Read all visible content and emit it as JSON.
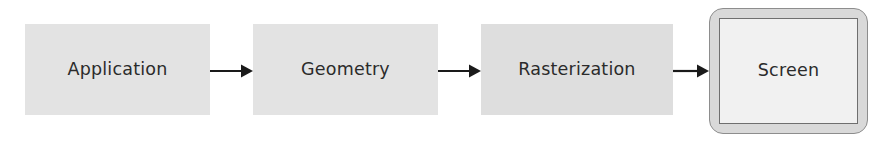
{
  "diagram": {
    "type": "flowchart",
    "orientation": "left-to-right",
    "background_color": "#ffffff",
    "stage_fill_color": "#e3e3e3",
    "screen_bezel_color": "#d9d9d9",
    "screen_inner_color": "#f1f1f1",
    "text_color": "#2b2b2b",
    "arrow_color": "#1a1a1a",
    "stages": [
      {
        "id": "application",
        "label": "Application",
        "shape": "rectangle"
      },
      {
        "id": "geometry",
        "label": "Geometry",
        "shape": "rectangle"
      },
      {
        "id": "rasterization",
        "label": "Rasterization",
        "shape": "rectangle"
      },
      {
        "id": "screen",
        "label": "Screen",
        "shape": "rounded-monitor"
      }
    ],
    "connectors": [
      {
        "id": "application-to-geometry",
        "from": "application",
        "to": "geometry",
        "style": "solid-arrow"
      },
      {
        "id": "geometry-to-rasterization",
        "from": "geometry",
        "to": "rasterization",
        "style": "solid-arrow"
      },
      {
        "id": "rasterization-to-screen",
        "from": "rasterization",
        "to": "screen",
        "style": "solid-arrow"
      }
    ]
  }
}
